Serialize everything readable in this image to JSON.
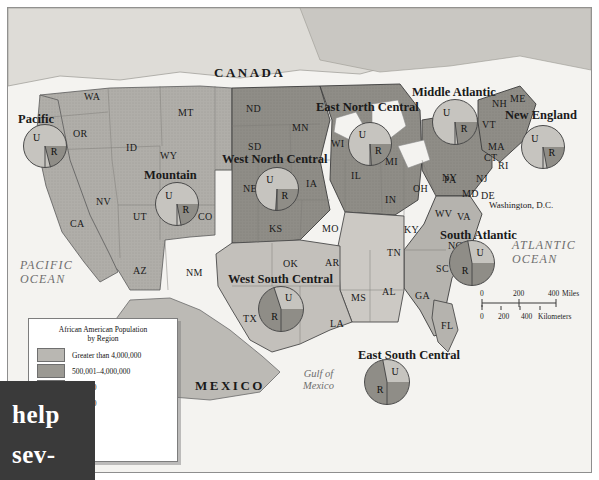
{
  "map": {
    "title": "African American Population by Region",
    "countries": [
      {
        "name": "CANADA",
        "x": 214,
        "y": 65
      },
      {
        "name": "MEXICO",
        "x": 195,
        "y": 378
      }
    ],
    "oceans": [
      {
        "name": "PACIFIC OCEAN",
        "line1": "PACIFIC",
        "line2": "OCEAN",
        "x": 20,
        "y": 258
      },
      {
        "name": "ATLANTIC OCEAN",
        "line1": "ATLANTIC",
        "line2": "OCEAN",
        "x": 512,
        "y": 238
      }
    ],
    "gulf": {
      "line1": "Gulf of",
      "line2": "Mexico",
      "x": 303,
      "y": 368
    },
    "dc_label": "Washington, D.C.",
    "states": [
      {
        "abbr": "WA",
        "x": 84,
        "y": 91
      },
      {
        "abbr": "OR",
        "x": 73,
        "y": 128
      },
      {
        "abbr": "ID",
        "x": 126,
        "y": 142
      },
      {
        "abbr": "MT",
        "x": 178,
        "y": 107
      },
      {
        "abbr": "ND",
        "x": 246,
        "y": 103
      },
      {
        "abbr": "SD",
        "x": 248,
        "y": 141
      },
      {
        "abbr": "MN",
        "x": 292,
        "y": 122
      },
      {
        "abbr": "WI",
        "x": 331,
        "y": 138
      },
      {
        "abbr": "MI",
        "x": 385,
        "y": 156
      },
      {
        "abbr": "NE",
        "x": 243,
        "y": 183
      },
      {
        "abbr": "IA",
        "x": 306,
        "y": 178
      },
      {
        "abbr": "IL",
        "x": 351,
        "y": 170
      },
      {
        "abbr": "IN",
        "x": 385,
        "y": 194
      },
      {
        "abbr": "OH",
        "x": 413,
        "y": 183
      },
      {
        "abbr": "NY",
        "x": 442,
        "y": 172
      },
      {
        "abbr": "PA",
        "x": 444,
        "y": 174
      },
      {
        "abbr": "WY",
        "x": 160,
        "y": 150
      },
      {
        "abbr": "NV",
        "x": 96,
        "y": 196
      },
      {
        "abbr": "UT",
        "x": 133,
        "y": 211
      },
      {
        "abbr": "CO",
        "x": 198,
        "y": 211
      },
      {
        "abbr": "KS",
        "x": 269,
        "y": 223
      },
      {
        "abbr": "MO",
        "x": 322,
        "y": 223
      },
      {
        "abbr": "KY",
        "x": 404,
        "y": 224
      },
      {
        "abbr": "WV",
        "x": 435,
        "y": 208
      },
      {
        "abbr": "VA",
        "x": 457,
        "y": 211
      },
      {
        "abbr": "MD",
        "x": 462,
        "y": 188
      },
      {
        "abbr": "DE",
        "x": 481,
        "y": 190
      },
      {
        "abbr": "NJ",
        "x": 476,
        "y": 173
      },
      {
        "abbr": "CT",
        "x": 484,
        "y": 152
      },
      {
        "abbr": "RI",
        "x": 498,
        "y": 160
      },
      {
        "abbr": "MA",
        "x": 488,
        "y": 141
      },
      {
        "abbr": "VT",
        "x": 482,
        "y": 119
      },
      {
        "abbr": "NH",
        "x": 492,
        "y": 98
      },
      {
        "abbr": "ME",
        "x": 510,
        "y": 93
      },
      {
        "abbr": "CA",
        "x": 70,
        "y": 218
      },
      {
        "abbr": "AZ",
        "x": 133,
        "y": 265
      },
      {
        "abbr": "NM",
        "x": 186,
        "y": 267
      },
      {
        "abbr": "OK",
        "x": 283,
        "y": 258
      },
      {
        "abbr": "AR",
        "x": 325,
        "y": 257
      },
      {
        "abbr": "TN",
        "x": 387,
        "y": 247
      },
      {
        "abbr": "NC",
        "x": 448,
        "y": 240
      },
      {
        "abbr": "SC",
        "x": 436,
        "y": 263
      },
      {
        "abbr": "GA",
        "x": 415,
        "y": 290
      },
      {
        "abbr": "AL",
        "x": 382,
        "y": 286
      },
      {
        "abbr": "MS",
        "x": 351,
        "y": 292
      },
      {
        "abbr": "LA",
        "x": 330,
        "y": 318
      },
      {
        "abbr": "TX",
        "x": 243,
        "y": 313
      },
      {
        "abbr": "FL",
        "x": 441,
        "y": 320
      }
    ],
    "regions": [
      {
        "name": "Pacific",
        "x": 18,
        "y": 112,
        "pie": {
          "cx": 45,
          "cy": 146,
          "r": 22,
          "urban_pct": 79,
          "labels": {
            "u": "U",
            "r": "R"
          }
        }
      },
      {
        "name": "Mountain",
        "x": 144,
        "y": 168,
        "pie": {
          "cx": 177,
          "cy": 204,
          "r": 22,
          "urban_pct": 78,
          "labels": {
            "u": "U",
            "r": "R"
          }
        }
      },
      {
        "name": "West North Central",
        "x": 222,
        "y": 152,
        "pie": {
          "cx": 277,
          "cy": 189,
          "r": 22,
          "urban_pct": 74,
          "labels": {
            "u": "U",
            "r": "R"
          }
        }
      },
      {
        "name": "East North Central",
        "x": 316,
        "y": 100,
        "pie": {
          "cx": 370,
          "cy": 144,
          "r": 22,
          "urban_pct": 76,
          "labels": {
            "u": "U",
            "r": "R"
          }
        }
      },
      {
        "name": "Middle Atlantic",
        "x": 412,
        "y": 85,
        "pie": {
          "cx": 455,
          "cy": 122,
          "r": 23,
          "urban_pct": 77,
          "labels": {
            "u": "U",
            "r": "R"
          }
        }
      },
      {
        "name": "New England",
        "x": 505,
        "y": 108,
        "pie": {
          "cx": 543,
          "cy": 147,
          "r": 22,
          "urban_pct": 78,
          "labels": {
            "u": "U",
            "r": "R"
          }
        }
      },
      {
        "name": "South Atlantic",
        "x": 440,
        "y": 228,
        "pie": {
          "cx": 472,
          "cy": 263,
          "r": 23,
          "urban_pct": 28,
          "labels": {
            "u": "U",
            "r": "R"
          }
        }
      },
      {
        "name": "West South Central",
        "x": 228,
        "y": 272,
        "pie": {
          "cx": 281,
          "cy": 309,
          "r": 23,
          "urban_pct": 30,
          "labels": {
            "u": "U",
            "r": "R"
          }
        }
      },
      {
        "name": "East South Central",
        "x": 358,
        "y": 348,
        "pie": {
          "cx": 387,
          "cy": 382,
          "r": 23,
          "urban_pct": 28,
          "labels": {
            "u": "U",
            "r": "R"
          }
        }
      }
    ],
    "legend": {
      "title_line1": "African American Population",
      "title_line2": "by Region",
      "rows": [
        {
          "label": "Greater than 4,000,000",
          "color": "#b9b7b2"
        },
        {
          "label": "500,001–4,000,000",
          "color": "#9b9993"
        },
        {
          "label": "500,000",
          "color": "#c9c7c2"
        },
        {
          "label": "100,000",
          "color": "#dcdad6"
        }
      ]
    },
    "scale": {
      "miles": {
        "ticks": [
          "0",
          "200",
          "400"
        ],
        "unit": "Miles"
      },
      "kilometers": {
        "ticks": [
          "0",
          "200",
          "400"
        ],
        "unit": "Kilometers"
      }
    }
  },
  "overlay": {
    "line1": "help",
    "line2": "sev-"
  },
  "chart_data": {
    "type": "pie",
    "series_labels": [
      "U",
      "R"
    ],
    "charts": [
      {
        "region": "Pacific",
        "values": [
          79,
          21
        ]
      },
      {
        "region": "Mountain",
        "values": [
          78,
          22
        ]
      },
      {
        "region": "West North Central",
        "values": [
          74,
          26
        ]
      },
      {
        "region": "East North Central",
        "values": [
          76,
          24
        ]
      },
      {
        "region": "Middle Atlantic",
        "values": [
          77,
          23
        ]
      },
      {
        "region": "New England",
        "values": [
          78,
          22
        ]
      },
      {
        "region": "South Atlantic",
        "values": [
          28,
          72
        ]
      },
      {
        "region": "West South Central",
        "values": [
          30,
          70
        ]
      },
      {
        "region": "East South Central",
        "values": [
          28,
          72
        ]
      }
    ]
  }
}
